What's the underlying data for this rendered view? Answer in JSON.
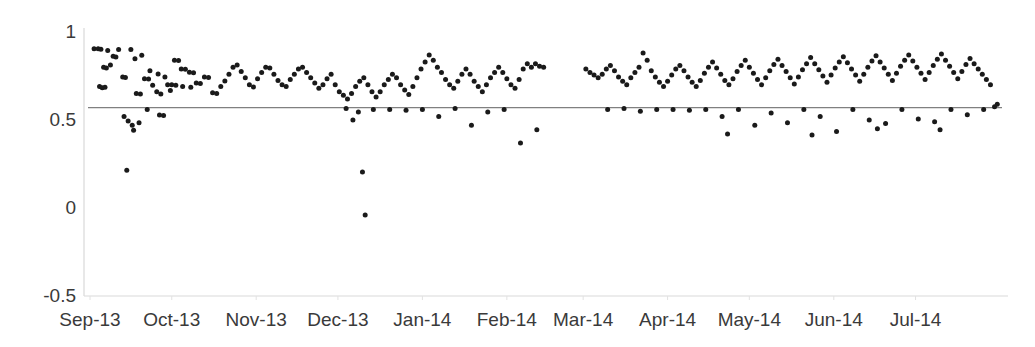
{
  "chart_data": {
    "type": "scatter",
    "title": "",
    "xlabel": "",
    "ylabel": "",
    "xlim": [
      0,
      334
    ],
    "ylim": [
      -0.5,
      1
    ],
    "grid": false,
    "legend": null,
    "y_ticks": [
      {
        "value": 1,
        "label": "1"
      },
      {
        "value": 0.5,
        "label": "0.5"
      },
      {
        "value": 0,
        "label": "0"
      },
      {
        "value": -0.5,
        "label": "-0.5"
      }
    ],
    "x_ticks": [
      {
        "value": 0,
        "label": "Sep-13"
      },
      {
        "value": 30,
        "label": "Oct-13"
      },
      {
        "value": 61,
        "label": "Nov-13"
      },
      {
        "value": 91,
        "label": "Dec-13"
      },
      {
        "value": 122,
        "label": "Jan-14"
      },
      {
        "value": 153,
        "label": "Feb-14"
      },
      {
        "value": 181,
        "label": "Mar-14"
      },
      {
        "value": 212,
        "label": "Apr-14"
      },
      {
        "value": 242,
        "label": "May-14"
      },
      {
        "value": 273,
        "label": "Jun-14"
      },
      {
        "value": 303,
        "label": "Jul-14"
      }
    ],
    "reference_line": {
      "orientation": "horizontal",
      "value": 0.57,
      "color": "#808080",
      "label": ""
    },
    "series": [
      {
        "name": "observations",
        "marker": "circle",
        "color": "#1a1a1a",
        "marker_size": 5,
        "points": [
          [
            1.5,
            0.905
          ],
          [
            3.0,
            0.905
          ],
          [
            4.0,
            0.902
          ],
          [
            6.5,
            0.895
          ],
          [
            8.5,
            0.862
          ],
          [
            9.5,
            0.858
          ],
          [
            10.5,
            0.9
          ],
          [
            5.0,
            0.8
          ],
          [
            6.0,
            0.796
          ],
          [
            7.5,
            0.812
          ],
          [
            12.0,
            0.745
          ],
          [
            13.0,
            0.742
          ],
          [
            3.5,
            0.69
          ],
          [
            4.5,
            0.683
          ],
          [
            5.5,
            0.686
          ],
          [
            17.0,
            0.65
          ],
          [
            18.5,
            0.648
          ],
          [
            20.0,
            0.735
          ],
          [
            21.5,
            0.733
          ],
          [
            23.0,
            0.698
          ],
          [
            24.5,
            0.66
          ],
          [
            26.0,
            0.648
          ],
          [
            15.0,
            0.9
          ],
          [
            16.5,
            0.848
          ],
          [
            19.0,
            0.868
          ],
          [
            22.0,
            0.78
          ],
          [
            25.0,
            0.762
          ],
          [
            27.5,
            0.745
          ],
          [
            28.5,
            0.7
          ],
          [
            29.5,
            0.668
          ],
          [
            12.5,
            0.52
          ],
          [
            14.0,
            0.495
          ],
          [
            15.5,
            0.47
          ],
          [
            16.0,
            0.442
          ],
          [
            18.0,
            0.485
          ],
          [
            21.0,
            0.56
          ],
          [
            25.5,
            0.528
          ],
          [
            27.0,
            0.525
          ],
          [
            13.5,
            0.215
          ],
          [
            31.0,
            0.84
          ],
          [
            32.5,
            0.838
          ],
          [
            33.5,
            0.79
          ],
          [
            35.0,
            0.788
          ],
          [
            36.5,
            0.772
          ],
          [
            38.0,
            0.768
          ],
          [
            30.0,
            0.7
          ],
          [
            31.5,
            0.698
          ],
          [
            34.0,
            0.69
          ],
          [
            37.0,
            0.686
          ],
          [
            39.0,
            0.71
          ],
          [
            40.5,
            0.708
          ],
          [
            42.0,
            0.745
          ],
          [
            43.5,
            0.742
          ],
          [
            45.0,
            0.655
          ],
          [
            46.5,
            0.65
          ],
          [
            48.0,
            0.69
          ],
          [
            49.5,
            0.722
          ],
          [
            51.0,
            0.76
          ],
          [
            52.5,
            0.8
          ],
          [
            54.0,
            0.812
          ],
          [
            55.5,
            0.775
          ],
          [
            57.0,
            0.74
          ],
          [
            58.5,
            0.7
          ],
          [
            60.0,
            0.688
          ],
          [
            61.5,
            0.735
          ],
          [
            63.0,
            0.77
          ],
          [
            64.5,
            0.8
          ],
          [
            66.0,
            0.795
          ],
          [
            67.5,
            0.76
          ],
          [
            69.0,
            0.725
          ],
          [
            70.5,
            0.7
          ],
          [
            72.0,
            0.69
          ],
          [
            73.5,
            0.73
          ],
          [
            75.0,
            0.76
          ],
          [
            76.5,
            0.79
          ],
          [
            78.0,
            0.8
          ],
          [
            79.5,
            0.77
          ],
          [
            81.0,
            0.74
          ],
          [
            82.5,
            0.71
          ],
          [
            84.0,
            0.68
          ],
          [
            85.5,
            0.7
          ],
          [
            87.0,
            0.735
          ],
          [
            88.5,
            0.76
          ],
          [
            90.0,
            0.7
          ],
          [
            91.5,
            0.66
          ],
          [
            93.0,
            0.64
          ],
          [
            94.5,
            0.62
          ],
          [
            96.0,
            0.65
          ],
          [
            97.5,
            0.69
          ],
          [
            99.0,
            0.72
          ],
          [
            100.5,
            0.74
          ],
          [
            102.0,
            0.7
          ],
          [
            103.5,
            0.66
          ],
          [
            105.0,
            0.63
          ],
          [
            106.5,
            0.66
          ],
          [
            108.0,
            0.7
          ],
          [
            109.5,
            0.73
          ],
          [
            111.0,
            0.76
          ],
          [
            112.5,
            0.74
          ],
          [
            114.0,
            0.7
          ],
          [
            115.5,
            0.67
          ],
          [
            117.0,
            0.645
          ],
          [
            118.5,
            0.69
          ],
          [
            120.0,
            0.74
          ],
          [
            121.5,
            0.79
          ],
          [
            123.0,
            0.83
          ],
          [
            124.5,
            0.87
          ],
          [
            126.0,
            0.84
          ],
          [
            127.5,
            0.8
          ],
          [
            129.0,
            0.77
          ],
          [
            130.5,
            0.73
          ],
          [
            132.0,
            0.7
          ],
          [
            133.5,
            0.68
          ],
          [
            135.0,
            0.72
          ],
          [
            136.5,
            0.76
          ],
          [
            138.0,
            0.79
          ],
          [
            139.5,
            0.76
          ],
          [
            141.0,
            0.72
          ],
          [
            142.5,
            0.69
          ],
          [
            144.0,
            0.66
          ],
          [
            145.5,
            0.7
          ],
          [
            147.0,
            0.74
          ],
          [
            148.5,
            0.77
          ],
          [
            150.0,
            0.8
          ],
          [
            151.5,
            0.77
          ],
          [
            153.0,
            0.735
          ],
          [
            154.5,
            0.7
          ],
          [
            156.0,
            0.68
          ],
          [
            157.5,
            0.73
          ],
          [
            159.0,
            0.79
          ],
          [
            160.5,
            0.82
          ],
          [
            162.0,
            0.8
          ],
          [
            163.5,
            0.82
          ],
          [
            165.0,
            0.805
          ],
          [
            166.5,
            0.8
          ],
          [
            94.0,
            0.565
          ],
          [
            96.5,
            0.5
          ],
          [
            98.5,
            0.545
          ],
          [
            104.0,
            0.56
          ],
          [
            110.0,
            0.56
          ],
          [
            116.0,
            0.555
          ],
          [
            122.0,
            0.56
          ],
          [
            128.0,
            0.52
          ],
          [
            134.0,
            0.565
          ],
          [
            140.0,
            0.47
          ],
          [
            146.0,
            0.545
          ],
          [
            152.0,
            0.56
          ],
          [
            158.0,
            0.37
          ],
          [
            164.0,
            0.445
          ],
          [
            100.0,
            0.205
          ],
          [
            101.0,
            -0.04
          ],
          [
            182.0,
            0.79
          ],
          [
            183.5,
            0.77
          ],
          [
            185.0,
            0.755
          ],
          [
            186.5,
            0.74
          ],
          [
            188.0,
            0.76
          ],
          [
            189.5,
            0.79
          ],
          [
            191.0,
            0.81
          ],
          [
            192.5,
            0.78
          ],
          [
            194.0,
            0.745
          ],
          [
            195.5,
            0.72
          ],
          [
            197.0,
            0.7
          ],
          [
            198.5,
            0.74
          ],
          [
            200.0,
            0.77
          ],
          [
            201.5,
            0.8
          ],
          [
            203.0,
            0.88
          ],
          [
            204.5,
            0.84
          ],
          [
            206.0,
            0.78
          ],
          [
            207.5,
            0.745
          ],
          [
            209.0,
            0.715
          ],
          [
            210.5,
            0.69
          ],
          [
            212.0,
            0.72
          ],
          [
            213.5,
            0.755
          ],
          [
            215.0,
            0.79
          ],
          [
            216.5,
            0.81
          ],
          [
            218.0,
            0.78
          ],
          [
            219.5,
            0.745
          ],
          [
            221.0,
            0.715
          ],
          [
            222.5,
            0.69
          ],
          [
            224.0,
            0.725
          ],
          [
            225.5,
            0.765
          ],
          [
            227.0,
            0.8
          ],
          [
            228.5,
            0.83
          ],
          [
            230.0,
            0.795
          ],
          [
            231.5,
            0.76
          ],
          [
            233.0,
            0.725
          ],
          [
            234.5,
            0.7
          ],
          [
            236.0,
            0.735
          ],
          [
            237.5,
            0.775
          ],
          [
            239.0,
            0.81
          ],
          [
            240.5,
            0.84
          ],
          [
            242.0,
            0.8
          ],
          [
            243.5,
            0.765
          ],
          [
            245.0,
            0.73
          ],
          [
            246.5,
            0.7
          ],
          [
            248.0,
            0.74
          ],
          [
            249.5,
            0.78
          ],
          [
            251.0,
            0.815
          ],
          [
            252.5,
            0.845
          ],
          [
            254.0,
            0.81
          ],
          [
            255.5,
            0.775
          ],
          [
            257.0,
            0.74
          ],
          [
            258.5,
            0.705
          ],
          [
            260.0,
            0.745
          ],
          [
            261.5,
            0.785
          ],
          [
            263.0,
            0.82
          ],
          [
            264.5,
            0.855
          ],
          [
            266.0,
            0.82
          ],
          [
            267.5,
            0.785
          ],
          [
            269.0,
            0.75
          ],
          [
            270.5,
            0.715
          ],
          [
            272.0,
            0.755
          ],
          [
            273.5,
            0.795
          ],
          [
            275.0,
            0.83
          ],
          [
            276.5,
            0.86
          ],
          [
            278.0,
            0.825
          ],
          [
            279.5,
            0.79
          ],
          [
            281.0,
            0.755
          ],
          [
            282.5,
            0.72
          ],
          [
            284.0,
            0.76
          ],
          [
            285.5,
            0.8
          ],
          [
            287.0,
            0.835
          ],
          [
            288.5,
            0.865
          ],
          [
            290.0,
            0.83
          ],
          [
            291.5,
            0.795
          ],
          [
            293.0,
            0.76
          ],
          [
            294.5,
            0.725
          ],
          [
            296.0,
            0.765
          ],
          [
            297.5,
            0.805
          ],
          [
            299.0,
            0.84
          ],
          [
            300.5,
            0.87
          ],
          [
            302.0,
            0.835
          ],
          [
            303.5,
            0.8
          ],
          [
            305.0,
            0.765
          ],
          [
            306.5,
            0.73
          ],
          [
            308.0,
            0.77
          ],
          [
            309.5,
            0.81
          ],
          [
            311.0,
            0.845
          ],
          [
            312.5,
            0.875
          ],
          [
            314.0,
            0.84
          ],
          [
            315.5,
            0.805
          ],
          [
            317.0,
            0.77
          ],
          [
            318.5,
            0.735
          ],
          [
            320.0,
            0.775
          ],
          [
            321.5,
            0.815
          ],
          [
            323.0,
            0.85
          ],
          [
            324.5,
            0.82
          ],
          [
            326.0,
            0.79
          ],
          [
            327.5,
            0.76
          ],
          [
            329.0,
            0.73
          ],
          [
            330.5,
            0.7
          ],
          [
            190.0,
            0.56
          ],
          [
            196.0,
            0.565
          ],
          [
            202.0,
            0.55
          ],
          [
            208.0,
            0.56
          ],
          [
            214.0,
            0.56
          ],
          [
            220.0,
            0.555
          ],
          [
            226.0,
            0.56
          ],
          [
            232.0,
            0.52
          ],
          [
            238.0,
            0.56
          ],
          [
            244.0,
            0.47
          ],
          [
            250.0,
            0.54
          ],
          [
            256.0,
            0.485
          ],
          [
            262.0,
            0.56
          ],
          [
            268.0,
            0.52
          ],
          [
            274.0,
            0.435
          ],
          [
            280.0,
            0.56
          ],
          [
            286.0,
            0.5
          ],
          [
            292.0,
            0.48
          ],
          [
            298.0,
            0.56
          ],
          [
            304.0,
            0.505
          ],
          [
            310.0,
            0.49
          ],
          [
            316.0,
            0.56
          ],
          [
            322.0,
            0.53
          ],
          [
            328.0,
            0.56
          ],
          [
            332.0,
            0.575
          ],
          [
            333.0,
            0.59
          ],
          [
            234.0,
            0.42
          ],
          [
            265.0,
            0.415
          ],
          [
            289.0,
            0.45
          ],
          [
            312.0,
            0.445
          ]
        ]
      }
    ]
  },
  "axis_style": {
    "axis_color": "#d9d9d9",
    "tick_label_color": "#3a3a3a",
    "background": "#ffffff"
  }
}
